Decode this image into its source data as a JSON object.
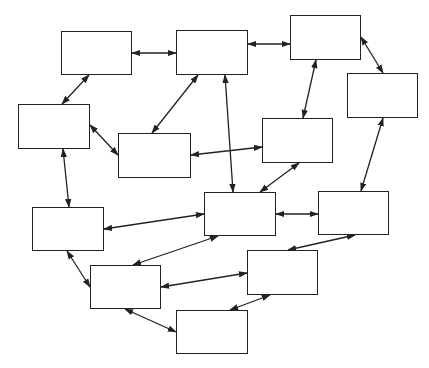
{
  "diagram": {
    "stroke_color": "#222222",
    "background": "#ffffff",
    "nodes": [
      {
        "id": "A",
        "x": 61,
        "y": 31,
        "w": 71,
        "h": 44
      },
      {
        "id": "B",
        "x": 18,
        "y": 104,
        "w": 72,
        "h": 45
      },
      {
        "id": "C",
        "x": 118,
        "y": 133,
        "w": 73,
        "h": 45
      },
      {
        "id": "D",
        "x": 176,
        "y": 30,
        "w": 72,
        "h": 45
      },
      {
        "id": "E",
        "x": 290,
        "y": 15,
        "w": 71,
        "h": 45
      },
      {
        "id": "F",
        "x": 347,
        "y": 73,
        "w": 71,
        "h": 45
      },
      {
        "id": "G",
        "x": 262,
        "y": 118,
        "w": 71,
        "h": 45
      },
      {
        "id": "H",
        "x": 32,
        "y": 207,
        "w": 72,
        "h": 44
      },
      {
        "id": "I",
        "x": 90,
        "y": 265,
        "w": 71,
        "h": 44
      },
      {
        "id": "J",
        "x": 176,
        "y": 310,
        "w": 72,
        "h": 44
      },
      {
        "id": "K",
        "x": 204,
        "y": 192,
        "w": 72,
        "h": 44
      },
      {
        "id": "L",
        "x": 318,
        "y": 191,
        "w": 71,
        "h": 44
      },
      {
        "id": "M",
        "x": 247,
        "y": 250,
        "w": 71,
        "h": 45
      }
    ],
    "edges": [
      {
        "from": "A",
        "to": "D",
        "x1": 132,
        "y1": 53,
        "x2": 176,
        "y2": 53
      },
      {
        "from": "A",
        "to": "B",
        "x1": 89,
        "y1": 75,
        "x2": 62,
        "y2": 104
      },
      {
        "from": "B",
        "to": "C",
        "x1": 90,
        "y1": 125,
        "x2": 118,
        "y2": 155
      },
      {
        "from": "C",
        "to": "D",
        "x1": 152,
        "y1": 133,
        "x2": 198,
        "y2": 75
      },
      {
        "from": "D",
        "to": "E",
        "x1": 248,
        "y1": 44,
        "x2": 290,
        "y2": 44
      },
      {
        "from": "D",
        "to": "K",
        "x1": 225,
        "y1": 75,
        "x2": 233,
        "y2": 192
      },
      {
        "from": "E",
        "to": "F",
        "x1": 361,
        "y1": 37,
        "x2": 383,
        "y2": 73
      },
      {
        "from": "E",
        "to": "G",
        "x1": 316,
        "y1": 60,
        "x2": 303,
        "y2": 118
      },
      {
        "from": "G",
        "to": "C",
        "x1": 262,
        "y1": 147,
        "x2": 191,
        "y2": 155
      },
      {
        "from": "G",
        "to": "K",
        "x1": 299,
        "y1": 163,
        "x2": 260,
        "y2": 192
      },
      {
        "from": "F",
        "to": "L",
        "x1": 383,
        "y1": 118,
        "x2": 361,
        "y2": 191
      },
      {
        "from": "K",
        "to": "L",
        "x1": 276,
        "y1": 214,
        "x2": 318,
        "y2": 214
      },
      {
        "from": "K",
        "to": "H",
        "x1": 204,
        "y1": 214,
        "x2": 104,
        "y2": 229
      },
      {
        "from": "K",
        "to": "I",
        "x1": 218,
        "y1": 236,
        "x2": 133,
        "y2": 265
      },
      {
        "from": "L",
        "to": "M",
        "x1": 355,
        "y1": 235,
        "x2": 288,
        "y2": 250
      },
      {
        "from": "M",
        "to": "I",
        "x1": 247,
        "y1": 273,
        "x2": 161,
        "y2": 287
      },
      {
        "from": "M",
        "to": "J",
        "x1": 270,
        "y1": 295,
        "x2": 230,
        "y2": 310
      },
      {
        "from": "B",
        "to": "H",
        "x1": 63,
        "y1": 149,
        "x2": 69,
        "y2": 207
      },
      {
        "from": "H",
        "to": "I",
        "x1": 67,
        "y1": 251,
        "x2": 90,
        "y2": 287
      },
      {
        "from": "I",
        "to": "J",
        "x1": 125,
        "y1": 309,
        "x2": 176,
        "y2": 332
      }
    ]
  }
}
